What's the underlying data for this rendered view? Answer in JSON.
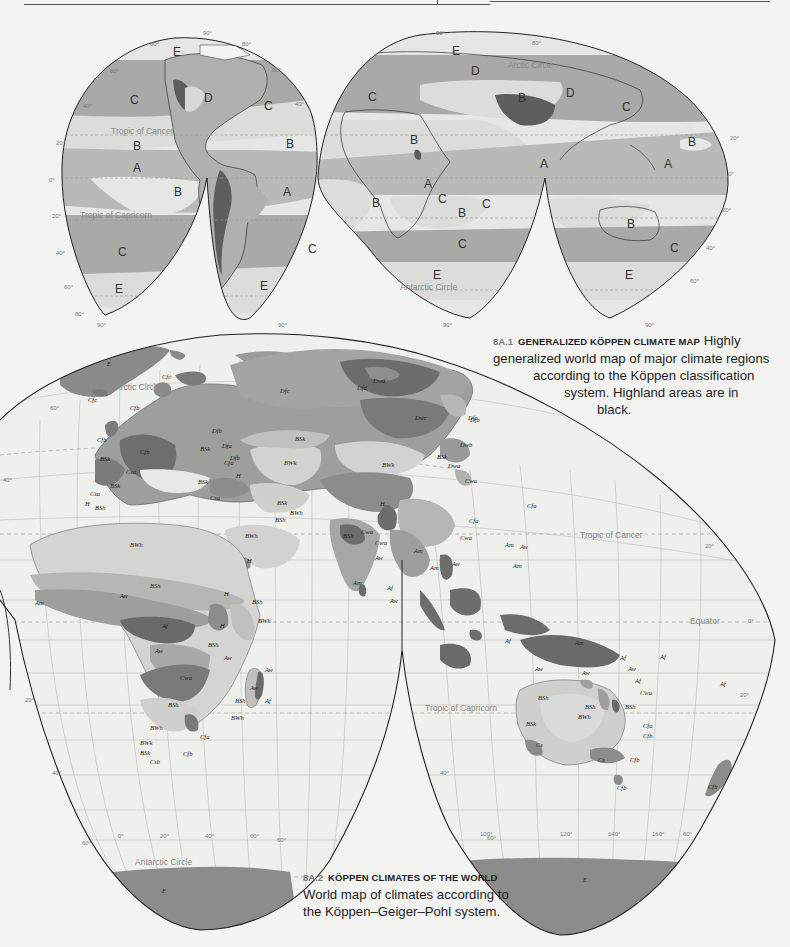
{
  "page": {
    "header_rule": true
  },
  "figure1": {
    "number": "8A.1",
    "title": "GENERALIZED KÖPPEN CLIMATE MAP",
    "caption_lines": [
      "Highly",
      "generalized world map of major climate regions",
      "according to the Köppen classification",
      "system. Highland areas are in",
      "black."
    ],
    "lines": {
      "tropic_cancer": "Tropic of Cancer",
      "tropic_capricorn": "Tropic of Capricorn",
      "arctic_circle": "Arctic Circle",
      "antarctic_circle": "Antarctic Circle"
    },
    "region_labels": {
      "na_e": "E",
      "na_c_pacific": "C",
      "na_d": "D",
      "na_c_atlantic": "C",
      "pac_b_north": "B",
      "pac_a": "A",
      "pac_b_south": "B",
      "pac_c_south": "C",
      "pac_e_south": "E",
      "atl_b_north": "B",
      "sa_a": "A",
      "sa_c": "C",
      "sa_e": "E",
      "eu_e": "E",
      "eu_c": "C",
      "eu_d": "D",
      "asia_b": "B",
      "asia_d": "D",
      "asia_c": "C",
      "af_b_north": "B",
      "af_a": "A",
      "af_c": "C",
      "af_b_south": "B",
      "af_c_east": "C",
      "atl_b_south": "B",
      "ind_c": "C",
      "ind_e": "E",
      "ind_a": "A",
      "pac_w_a": "A",
      "pac_w_b": "B",
      "aus_b": "B",
      "aus_c": "C",
      "aus_e": "E"
    },
    "degree_labels": [
      "90°",
      "80°",
      "60°",
      "40°",
      "20°",
      "0°",
      "20°",
      "40°",
      "60°",
      "80°",
      "90°"
    ]
  },
  "figure2": {
    "number": "8A.2",
    "title": "KÖPPEN CLIMATES OF THE WORLD",
    "caption_lines": [
      "World map of climates according to",
      "the Köppen–Geiger–Pohl system."
    ],
    "lines": {
      "arctic_circle": "Arctic Circle",
      "tropic_cancer": "Tropic of Cancer",
      "equator": "Equator",
      "tropic_capricorn": "Tropic of Capricorn",
      "antarctic_circle": "Antarctic Circle"
    },
    "longitude_labels": [
      "0°",
      "20°",
      "40°",
      "60°",
      "80°",
      "100°",
      "120°",
      "140°",
      "160°"
    ],
    "latitude_labels": [
      "60°",
      "40°",
      "20°",
      "0°",
      "20°",
      "40°",
      "60°"
    ],
    "region_labels": {
      "greenland": "E",
      "iceland": "Cfc",
      "scand_cfc": "Cfc",
      "norway_cfb": "Cfb",
      "uk_cfb": "Cfb",
      "france_cfb": "Cfb",
      "iberia_bsk": "BSk",
      "med_csa": "Csa",
      "spain_bsk": "BSk",
      "nafrica_csa": "Csa",
      "nafrica_bsh": "BSh",
      "nafrica_h": "H",
      "russia_dfb": "Dfb",
      "siberia_dfc": "Dfc",
      "siberia_dwd": "Dwd",
      "siberia_dfd": "Dfd",
      "siberia_dwc": "Dwc",
      "kamchatka_dfc": "Dfc",
      "blacksea_bsk": "BSk",
      "blacksea_dfa": "Dfa",
      "blacksea_cfa": "Cfa",
      "turkey_bsk": "BSk",
      "turkey_h": "H",
      "caspian_dfb": "Dfb",
      "kazakh_bsk": "BSk",
      "aral_bwk": "BWk",
      "gobi_bwk": "BWk",
      "iran_bsk": "BSk",
      "iran_bwh": "BWh",
      "iran_bsh": "BSh",
      "iran_csa": "Csa",
      "tibet_h": "H",
      "mongolia_bsk": "BSk",
      "china_dwb": "Dwb",
      "china_dwa": "Dwa",
      "japan_dfb": "Dfb",
      "korea_cwa": "Cwa",
      "japan_cfa": "Cfa",
      "china_cfa": "Cfa",
      "china_cwa": "Cwa",
      "india_cwa": "Cwa",
      "india_csaw": "Cwa",
      "india_bsh": "BSh",
      "india_aw": "Aw",
      "india_am": "Am",
      "srilanka_af": "Af",
      "srilanka_aw": "Aw",
      "burma_am": "Am",
      "seasia_aw": "Aw",
      "seasia_am": "Am",
      "philippines_am": "Am",
      "philippines_aw": "Aw",
      "taiwan_am": "Am",
      "sahara_bwh": "BWh",
      "arabia_bwh": "BWh",
      "yemen_h": "H",
      "sahel_bsh": "BSh",
      "westafrica_aw": "Aw",
      "westafrica_am": "Am",
      "ethiopia_h": "H",
      "horn_bsh": "BSh",
      "somalia_bwh": "BWh",
      "congo_af": "Af",
      "eastafrica_h": "H",
      "eastafrica_bsh": "BSh",
      "eastafrica_aw": "Aw",
      "angola_aw": "Aw",
      "zambia_cwa": "Cwa",
      "kalahari_bsh": "BSh",
      "namib_bwh": "BWh",
      "sa_bwk": "BWk",
      "sa_bsk": "BSk",
      "sa_csb": "Csb",
      "sa_cfb": "Cfb",
      "sa_cfa": "Cfa",
      "madagascar_aw_n": "Aw",
      "madagascar_aw": "Aw",
      "madagascar_bsh": "BSh",
      "madagascar_af": "Af",
      "madagascar_bwh": "BWh",
      "indonesia_af": "Af",
      "newguinea_af": "Af",
      "timor_am": "Am",
      "pacific_af": "Af",
      "pacific_af2": "Af",
      "aus_aw_nw": "Aw",
      "aus_aw_n": "Aw",
      "aus_aw_ne": "Aw",
      "aus_af": "Af",
      "aus_bsh_w": "BSh",
      "aus_bsh_center": "BSh",
      "aus_bwh": "BWh",
      "aus_bsh_e": "BSh",
      "aus_bsk": "BSk",
      "aus_cwa": "Cwa",
      "aus_cfa": "Cfa",
      "aus_cfb_e": "Cfb",
      "aus_cs_w": "Cs",
      "aus_cs_s": "Cs",
      "aus_cfb_se": "Cfb",
      "tasmania_cfb": "Cfb",
      "nz_cfb": "Cfb",
      "antarctica_e": "E"
    }
  }
}
